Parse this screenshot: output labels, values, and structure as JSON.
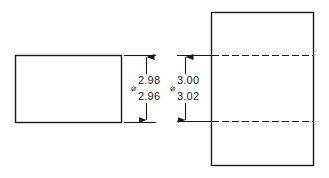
{
  "diagram": {
    "type": "engineering-drawing",
    "shaft": {
      "label": "shaft",
      "diameter_symbol": "⌀",
      "upper_limit": "2.98",
      "lower_limit": "2.96"
    },
    "hole": {
      "label": "hole",
      "diameter_symbol": "⌀",
      "upper_limit": "3.00",
      "lower_limit": "3.02"
    },
    "colors": {
      "line": "#1a1a1a",
      "background": "#ffffff"
    }
  }
}
